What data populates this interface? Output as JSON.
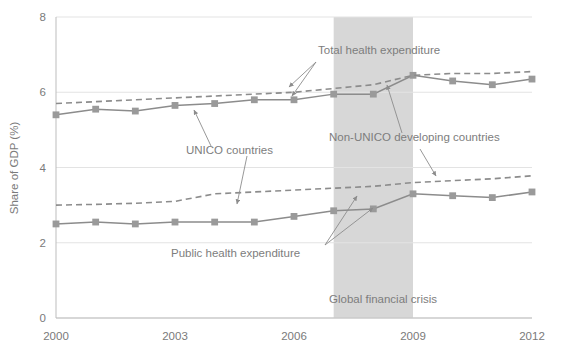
{
  "chart_data": {
    "type": "line",
    "title": "",
    "xlabel": "",
    "ylabel": "Share of GDP (%)",
    "xlim": [
      2000,
      2012
    ],
    "ylim": [
      0,
      8
    ],
    "yticks": [
      0,
      2,
      4,
      6,
      8
    ],
    "ytick_labels": [
      "0",
      "2",
      "4",
      "6",
      "8"
    ],
    "xticks": [
      2000,
      2003,
      2006,
      2009,
      2012
    ],
    "xtick_labels": [
      "2000",
      "2003",
      "2006",
      "2009",
      "2012"
    ],
    "grid": "horizontal",
    "legend": "none (series labeled via annotations)",
    "x": [
      2000,
      2001,
      2002,
      2003,
      2004,
      2005,
      2006,
      2007,
      2008,
      2009,
      2010,
      2011,
      2012
    ],
    "series": [
      {
        "name": "Total health expenditure, UNICO countries",
        "style": "solid",
        "marker": "square",
        "color": "#8c8c8c",
        "values": [
          5.4,
          5.55,
          5.5,
          5.65,
          5.7,
          5.8,
          5.8,
          5.95,
          5.95,
          6.45,
          6.3,
          6.2,
          6.35
        ]
      },
      {
        "name": "Total health expenditure, Non-UNICO developing countries",
        "style": "dashed",
        "marker": "none",
        "color": "#8c8c8c",
        "values": [
          5.7,
          5.75,
          5.8,
          5.85,
          5.9,
          5.95,
          6.0,
          6.1,
          6.2,
          6.45,
          6.5,
          6.5,
          6.55
        ]
      },
      {
        "name": "Public health expenditure, UNICO countries",
        "style": "solid",
        "marker": "square",
        "color": "#8c8c8c",
        "values": [
          2.5,
          2.55,
          2.5,
          2.55,
          2.55,
          2.55,
          2.7,
          2.85,
          2.9,
          3.3,
          3.25,
          3.2,
          3.35
        ]
      },
      {
        "name": "Public health expenditure, Non-UNICO developing countries",
        "style": "dashed",
        "marker": "none",
        "color": "#8c8c8c",
        "values": [
          3.0,
          3.02,
          3.05,
          3.1,
          3.3,
          3.35,
          3.4,
          3.45,
          3.5,
          3.6,
          3.65,
          3.7,
          3.78
        ]
      }
    ],
    "shaded_region": {
      "label": "Global financial crisis",
      "x_start": 2007.0,
      "x_end": 2009.0,
      "color": "#d7d7d7"
    },
    "annotations": [
      {
        "text": "Total health expenditure",
        "x": 318,
        "y": 54
      },
      {
        "text": "UNICO countries",
        "x": 186,
        "y": 154
      },
      {
        "text": "Non-UNICO developing countries",
        "x": 329,
        "y": 141
      },
      {
        "text": "Public health expenditure",
        "x": 171,
        "y": 257
      },
      {
        "text": "Global financial crisis",
        "x": 329,
        "y": 303
      }
    ]
  },
  "colors": {
    "background": "#ffffff",
    "line": "#8c8c8c",
    "marker": "#9a9a9a",
    "grid": "#e3e3e3",
    "axis": "#b9b9b9",
    "text": "#7a7a7a",
    "shade": "#d7d7d7"
  }
}
